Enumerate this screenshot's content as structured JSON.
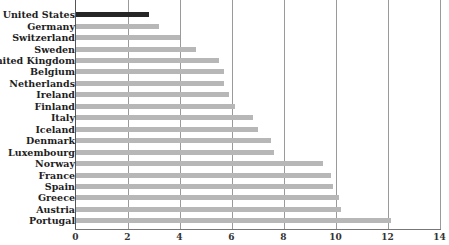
{
  "chart_data": {
    "type": "bar",
    "orientation": "horizontal",
    "title": "",
    "xlabel": "",
    "ylabel": "",
    "xlim": [
      0,
      14
    ],
    "xticks": [
      0,
      2,
      4,
      6,
      8,
      10,
      12,
      14
    ],
    "grid": true,
    "highlight_color": "#262626",
    "bar_color": "#b7b7b7",
    "categories": [
      "United States",
      "Germany",
      "Switzerland",
      "Sweden",
      "United Kingdom",
      "Belgium",
      "Netherlands",
      "Ireland",
      "Finland",
      "Italy",
      "Iceland",
      "Denmark",
      "Luxembourg",
      "Norway",
      "France",
      "Spain",
      "Greece",
      "Austria",
      "Portugal"
    ],
    "values": [
      2.8,
      3.2,
      4.0,
      4.6,
      5.5,
      5.7,
      5.7,
      5.9,
      6.1,
      6.8,
      7.0,
      7.5,
      7.6,
      9.5,
      9.8,
      9.9,
      10.1,
      10.2,
      12.1
    ],
    "highlighted": [
      "United States"
    ]
  }
}
